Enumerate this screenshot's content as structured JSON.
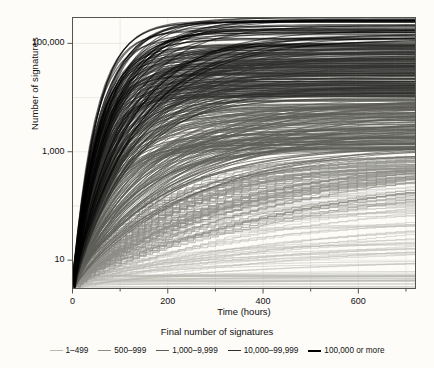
{
  "chart_data": {
    "type": "line",
    "title": "",
    "xlabel": "Time (hours)",
    "ylabel": "Number of signatures",
    "xlim": [
      0,
      720
    ],
    "ylim": [
      3,
      300000
    ],
    "yscale": "log",
    "grid": true,
    "legend_position": "bottom",
    "legend_title": "Final number of signatures",
    "xticks": [
      0,
      200,
      400,
      600
    ],
    "xticklabels": [
      "0",
      "200",
      "400",
      "600"
    ],
    "xminorticks": [
      100,
      300,
      500,
      700
    ],
    "yticks": [
      10,
      1000,
      100000
    ],
    "yticklabels": [
      "10",
      "1,000",
      "100,000"
    ],
    "series": [
      {
        "name": "1–499",
        "color": "#b9b9b2",
        "width": 0.7,
        "final_range": [
          1,
          499
        ],
        "count": 90
      },
      {
        "name": "500–999",
        "color": "#8e8e86",
        "width": 0.8,
        "final_range": [
          500,
          999
        ],
        "count": 70
      },
      {
        "name": "1,000–9,999",
        "color": "#5d5d57",
        "width": 0.9,
        "final_range": [
          1000,
          9999
        ],
        "count": 150
      },
      {
        "name": "10,000–99,999",
        "color": "#2e2e2b",
        "width": 1.0,
        "final_range": [
          10000,
          99999
        ],
        "count": 190
      },
      {
        "name": "100,000 or more",
        "color": "#000000",
        "width": 1.2,
        "final_range": [
          100000,
          300000
        ],
        "count": 40
      }
    ]
  },
  "axes": {
    "x_tick_labels": [
      "0",
      "200",
      "400",
      "600"
    ],
    "y_tick_labels": [
      "100,000",
      "1,000",
      "10"
    ],
    "x_axis_label": "Time (hours)",
    "y_axis_label": "Number of signatures"
  },
  "legend": {
    "title": "Final number of signatures",
    "items": [
      {
        "label": "1–499",
        "color": "#b9b9b2"
      },
      {
        "label": "500–999",
        "color": "#8e8e86"
      },
      {
        "label": "1,000–9,999",
        "color": "#5d5d57"
      },
      {
        "label": "10,000–99,999",
        "color": "#2e2e2b"
      },
      {
        "label": "100,000 or more",
        "color": "#000000"
      }
    ]
  },
  "style": {
    "background": "#fdfcf9",
    "plot_background": "#fdfcf9",
    "axis_color": "#4a4a45",
    "grid_color": "#e8e6de"
  }
}
